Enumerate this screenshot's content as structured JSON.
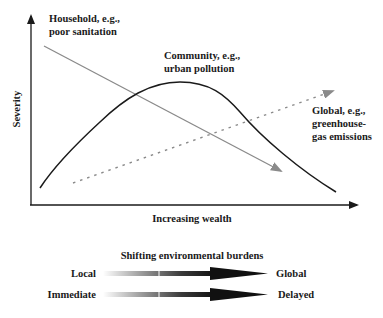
{
  "diagram": {
    "type": "conceptual-curves",
    "axes": {
      "y_label": "Severity",
      "x_label": "Increasing wealth"
    },
    "curves": [
      {
        "name": "household",
        "label_lines": [
          "Household, e.g.,",
          "poor sanitation"
        ],
        "shape": "declining line",
        "style": "solid-gray-arrow",
        "color": "#808080"
      },
      {
        "name": "community",
        "label_lines": [
          "Community, e.g.,",
          "urban pollution"
        ],
        "shape": "inverted-U",
        "style": "solid-black",
        "color": "#1a1a1a"
      },
      {
        "name": "global",
        "label_lines": [
          "Global, e.g.,",
          "greenhouse-",
          "gas emissions"
        ],
        "shape": "rising line",
        "style": "dotted-gray-arrow",
        "color": "#808080"
      }
    ],
    "legend": {
      "title": "Shifting environmental burdens",
      "rows": [
        {
          "from": "Local",
          "to": "Global"
        },
        {
          "from": "Immediate",
          "to": "Delayed"
        }
      ]
    }
  }
}
